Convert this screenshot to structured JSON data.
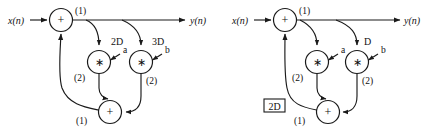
{
  "figure": {
    "type": "signal-flow-graph",
    "background_color": "#ffffff",
    "line_color": "#1a1a1a"
  },
  "diagrams": [
    {
      "id": "left",
      "input_label": "x(n)",
      "output_label": "y(n)",
      "summing_nodes": [
        {
          "name": "top-adder",
          "symbol": "+",
          "branch_label": "(1)"
        },
        {
          "name": "bottom-adder",
          "symbol": "+",
          "branch_label": "(1)"
        }
      ],
      "multiplier_nodes": [
        {
          "name": "multiplier-a",
          "symbol": "∗",
          "coefficient": "a",
          "branch_label": "(2)"
        },
        {
          "name": "multiplier-b",
          "symbol": "∗",
          "coefficient": "b",
          "branch_label": "(2)"
        }
      ],
      "delay_labels": [
        {
          "name": "delay-2d",
          "text": "2D",
          "boxed": false
        },
        {
          "name": "delay-3d",
          "text": "3D",
          "boxed": false
        }
      ]
    },
    {
      "id": "right",
      "input_label": "x(n)",
      "output_label": "y(n)",
      "summing_nodes": [
        {
          "name": "top-adder",
          "symbol": "+",
          "branch_label": "(1)"
        },
        {
          "name": "bottom-adder",
          "symbol": "+",
          "branch_label": "(1)"
        }
      ],
      "multiplier_nodes": [
        {
          "name": "multiplier-a",
          "symbol": "∗",
          "coefficient": "a",
          "branch_label": "(2)"
        },
        {
          "name": "multiplier-b",
          "symbol": "∗",
          "coefficient": "b",
          "branch_label": "(2)"
        }
      ],
      "delay_labels": [
        {
          "name": "delay-d",
          "text": "D",
          "boxed": false
        },
        {
          "name": "delay-2d-boxed",
          "text": "2D",
          "boxed": true
        }
      ]
    }
  ]
}
